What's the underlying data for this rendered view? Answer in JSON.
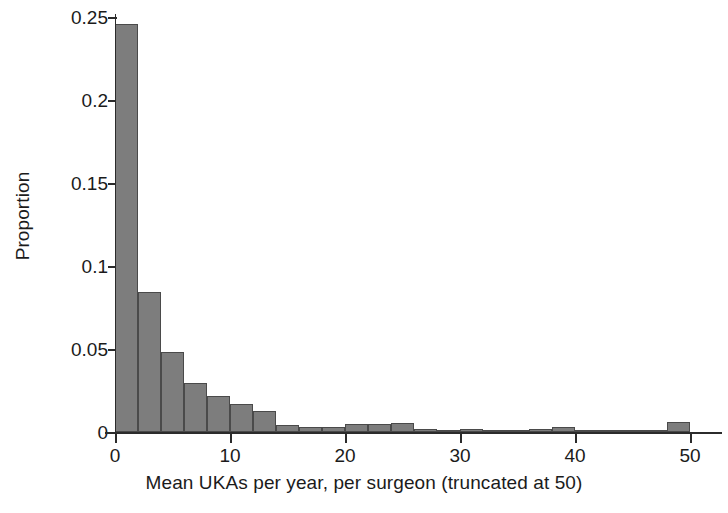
{
  "chart_data": {
    "type": "bar",
    "title": "",
    "subtitle": "",
    "xlabel": "Mean UKAs per year, per surgeon (truncated at 50)",
    "ylabel": "Proportion",
    "xlim": [
      0,
      50
    ],
    "ylim": [
      0,
      0.25
    ],
    "grid": false,
    "legend": null,
    "bin_width": 2,
    "x_tick_labels": [
      "0",
      "10",
      "20",
      "30",
      "40",
      "50"
    ],
    "x_tick_values": [
      0,
      10,
      20,
      30,
      40,
      50
    ],
    "y_tick_labels": [
      "0",
      "0.05",
      "0.1",
      "0.15",
      "0.2",
      "0.25"
    ],
    "y_tick_values": [
      0,
      0.05,
      0.1,
      0.15,
      0.2,
      0.25
    ],
    "bar_color": "#7d7d7d",
    "bar_edge_color": "#4a4a4a",
    "axis_color": "#2b2b2b",
    "background_color": "#ffffff",
    "bin_starts": [
      0,
      2,
      4,
      6,
      8,
      10,
      12,
      14,
      16,
      18,
      20,
      22,
      24,
      26,
      28,
      30,
      32,
      34,
      36,
      38,
      40,
      42,
      44,
      46,
      48
    ],
    "categories": [
      "0-2",
      "2-4",
      "4-6",
      "6-8",
      "8-10",
      "10-12",
      "12-14",
      "14-16",
      "16-18",
      "18-20",
      "20-22",
      "22-24",
      "24-26",
      "26-28",
      "28-30",
      "30-32",
      "32-34",
      "34-36",
      "36-38",
      "38-40",
      "40-42",
      "42-44",
      "44-46",
      "46-48",
      "48-50"
    ],
    "values": [
      0.2455,
      0.0843,
      0.0482,
      0.0295,
      0.0217,
      0.0169,
      0.0127,
      0.0042,
      0.003,
      0.003,
      0.0048,
      0.0048,
      0.0054,
      0.0018,
      0.0006,
      0.0018,
      0.0006,
      0.0006,
      0.0018,
      0.003,
      0.0012,
      0.0006,
      0.0006,
      0.0012,
      0.006
    ]
  },
  "axes": {
    "ylabel_text": "Proportion",
    "xlabel_text": "Mean UKAs per year, per surgeon (truncated at 50)"
  }
}
